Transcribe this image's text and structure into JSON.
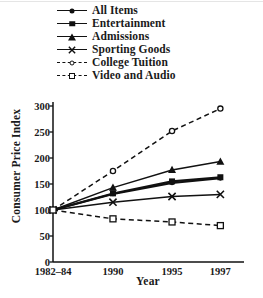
{
  "chart_data": {
    "type": "line",
    "title": "",
    "xlabel": "Year",
    "ylabel": "Consumer Price Index",
    "categories": [
      "1982–84",
      "1990",
      "1995",
      "1997"
    ],
    "x": [
      0,
      1,
      2,
      3
    ],
    "ylim": [
      0,
      300
    ],
    "yticks": [
      0,
      50,
      100,
      150,
      200,
      250,
      300
    ],
    "grid": false,
    "legend_position": "above-plot",
    "series": [
      {
        "name": "All Items",
        "values": [
          100,
          131,
          152,
          161
        ],
        "marker": "filled-circle",
        "line": "solid",
        "color": "#111111"
      },
      {
        "name": "Entertainment",
        "values": [
          100,
          132,
          155,
          163
        ],
        "marker": "filled-square",
        "line": "solid",
        "color": "#111111"
      },
      {
        "name": "Admissions",
        "values": [
          100,
          143,
          177,
          193
        ],
        "marker": "filled-triangle",
        "line": "solid",
        "color": "#111111"
      },
      {
        "name": "Sporting Goods",
        "values": [
          100,
          115,
          126,
          130
        ],
        "marker": "cross-x",
        "line": "solid",
        "color": "#111111"
      },
      {
        "name": "College Tuition",
        "values": [
          100,
          175,
          252,
          295
        ],
        "marker": "open-circle",
        "line": "dashed",
        "color": "#111111"
      },
      {
        "name": "Video and Audio",
        "values": [
          100,
          83,
          77,
          70
        ],
        "marker": "open-square",
        "line": "dashed",
        "color": "#111111"
      }
    ]
  },
  "legend": {
    "items": [
      {
        "label": "All Items",
        "marker": "filled-circle",
        "line": "solid"
      },
      {
        "label": "Entertainment",
        "marker": "filled-square",
        "line": "solid"
      },
      {
        "label": "Admissions",
        "marker": "filled-triangle",
        "line": "solid"
      },
      {
        "label": "Sporting Goods",
        "marker": "cross-x",
        "line": "solid"
      },
      {
        "label": "College Tuition",
        "marker": "open-circle",
        "line": "dashed"
      },
      {
        "label": "Video and Audio",
        "marker": "open-square",
        "line": "dashed"
      }
    ]
  },
  "axes": {
    "y_label": "Consumer Price Index",
    "x_label": "Year",
    "y_ticks": [
      "300",
      "250",
      "200",
      "150",
      "100",
      "50",
      "0"
    ],
    "x_ticks": [
      "1982–84",
      "1990",
      "1995",
      "1997"
    ]
  }
}
